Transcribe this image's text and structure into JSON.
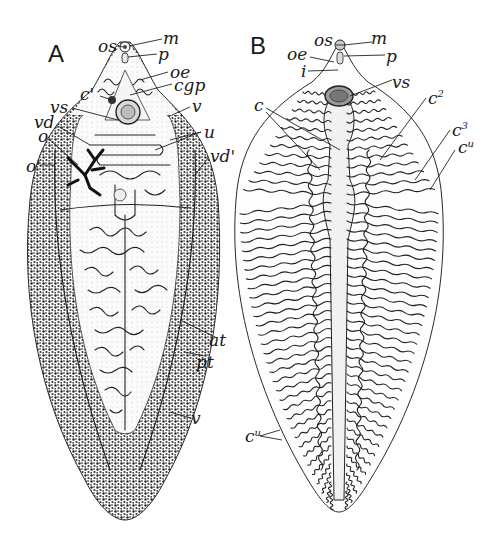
{
  "figure": {
    "colors": {
      "ink": "#1a1a1a",
      "background": "#ffffff",
      "stipple": "#2a2a2a",
      "fill_light": "#f1f1f1"
    },
    "panels": [
      {
        "id": "A",
        "label": "A",
        "annotations": [
          {
            "key": "os",
            "text": "os"
          },
          {
            "key": "m",
            "text": "m"
          },
          {
            "key": "p",
            "text": "p"
          },
          {
            "key": "oe",
            "text": "oe"
          },
          {
            "key": "cgp",
            "text": "cgp"
          },
          {
            "key": "c1",
            "text": "c'"
          },
          {
            "key": "v_top",
            "text": "v"
          },
          {
            "key": "vs",
            "text": "vs"
          },
          {
            "key": "vd",
            "text": "vd"
          },
          {
            "key": "u",
            "text": "u"
          },
          {
            "key": "o",
            "text": "o"
          },
          {
            "key": "vd1",
            "text": "vd'"
          },
          {
            "key": "o1",
            "text": "o'"
          },
          {
            "key": "at",
            "text": "at"
          },
          {
            "key": "pt",
            "text": "pt"
          },
          {
            "key": "v_bottom",
            "text": "v"
          }
        ]
      },
      {
        "id": "B",
        "label": "B",
        "annotations": [
          {
            "key": "os",
            "text": "os"
          },
          {
            "key": "m",
            "text": "m"
          },
          {
            "key": "p",
            "text": "p"
          },
          {
            "key": "oe",
            "text": "oe"
          },
          {
            "key": "i",
            "text": "i"
          },
          {
            "key": "vs",
            "text": "vs"
          },
          {
            "key": "c",
            "text": "c"
          },
          {
            "key": "c2",
            "text": "c",
            "sup": "2"
          },
          {
            "key": "c3",
            "text": "c",
            "sup": "3"
          },
          {
            "key": "cu_right",
            "text": "c",
            "sup": "u"
          },
          {
            "key": "cu_left",
            "text": "c",
            "sup": "u"
          }
        ]
      }
    ]
  }
}
